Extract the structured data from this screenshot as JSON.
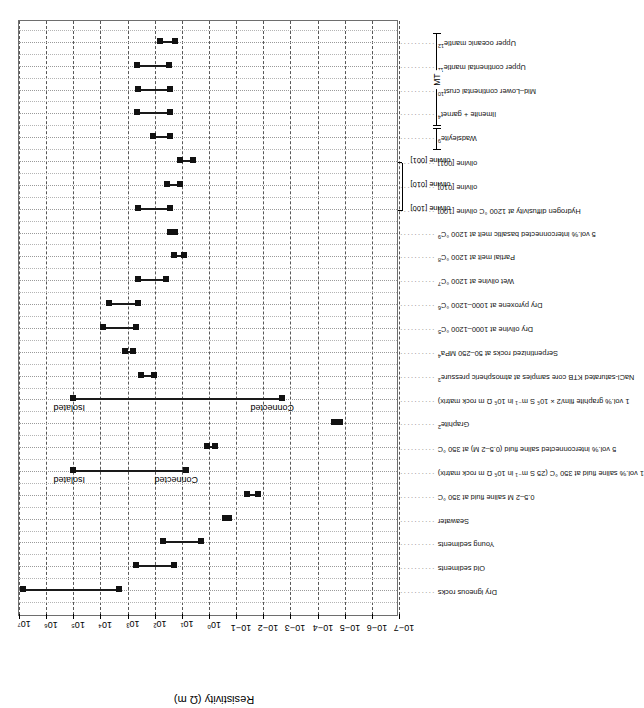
{
  "chart_data": {
    "type": "bar",
    "chart_kind": "range-interval (floating bar) plot, log scale",
    "title": "",
    "xlabel": "",
    "ylabel": "Resistivity (Ω m)",
    "ylim": [
      1e-07,
      10000000.0
    ],
    "y_scale": "log10",
    "grid": true,
    "legend": "none",
    "ytick_labels": [
      "10−7",
      "10−6",
      "10−5",
      "10−4",
      "10−3",
      "10−2",
      "10−1",
      "10⁰",
      "10¹",
      "10²",
      "10³",
      "10⁴",
      "10⁵",
      "10⁶",
      "10⁷"
    ],
    "ytick_values": [
      1e-07,
      1e-06,
      1e-05,
      0.0001,
      0.001,
      0.01,
      0.1,
      1,
      10,
      100,
      1000,
      10000,
      100000,
      1000000,
      10000000
    ],
    "categories": [
      "Dry igneous rocks",
      "Old sediments",
      "Young sediments",
      "Seawater",
      "0.5–2 M saline fluid at 350 °C",
      "1 vol.% saline fluid at 350 °C (25 S m⁻¹ in 10⁵ Ω m rock matrix)",
      "5 vol.% interconnected saline fluid (0.5–2 M) at 350 °C",
      "Graphite",
      "1 vol.% graphite film/2 × 10⁵ S m⁻¹ in 10⁵ Ω m rock matrix)",
      "NaCl-saturated KTB core samples at atmospheric pressure",
      "Serpentinized rocks at 50–250 MPa",
      "Dry olivine at 1000–1200 °C",
      "Dry pyroxene at 1000–1200 °C",
      "Wet olivine at 1200 °C",
      "Partial melt at 1200 °C",
      "5 vol.% interconnected basaltic melt at 1200 °C",
      "Hydrogen diffusivity at 1200 °C  olivine [100]",
      "olivine [010]",
      "olivine [001]",
      "Wadsleyite",
      "Ilmenite + garnet",
      "Mid–Lower continental crust",
      "Upper continental mantle",
      "Upper oceanic mantle"
    ],
    "category_superscripts": {
      "0.5–2 M saline fluid at 350 °C": "",
      "Graphite": "2",
      "NaCl-saturated KTB core samples at atmospheric pressure": "3",
      "Serpentinized rocks at 50–250 MPa": "4",
      "Dry olivine at 1000–1200 °C": "5",
      "Dry pyroxene at 1000–1200 °C": "6",
      "Wet olivine at 1200 °C": "7",
      "Partial melt at 1200 °C": "8",
      "5 vol.% interconnected basaltic melt at 1200 °C": "9",
      "Hydrogen diffusivity at 1200 °C": "10",
      "Wadsleyite": "9",
      "Ilmenite + garnet": "4",
      "Mid–Lower continental crust": "10",
      "Upper continental mantle": "11",
      "Upper oceanic mantle": "12"
    },
    "ranges": [
      {
        "category": "Dry igneous rocks",
        "low": 2000.0,
        "high": 7000000.0
      },
      {
        "category": "Old sediments",
        "low": 20.0,
        "high": 500.0
      },
      {
        "category": "Young sediments",
        "low": 2,
        "high": 50.0
      },
      {
        "category": "Seawater",
        "low": 0.18,
        "high": 0.26
      },
      {
        "category": "0.5–2 M saline fluid at 350 °C",
        "low": 0.015,
        "high": 0.04
      },
      {
        "category": "1 vol.% saline fluid at 350 °C",
        "low": 7,
        "high": 100000.0,
        "note_top": "Isolated",
        "note_bottom": "Connected"
      },
      {
        "category": "5 vol.% interconnected saline fluid",
        "low": 0.6,
        "high": 1.2
      },
      {
        "category": "Graphite",
        "low": 1.5e-05,
        "high": 2.5e-05
      },
      {
        "category": "1 vol.% graphite film",
        "low": 0.002,
        "high": 100000.0,
        "note_top": "Isolated",
        "note_bottom": "Connected"
      },
      {
        "category": "NaCl-saturated KTB core samples",
        "low": 110.0,
        "high": 320.0
      },
      {
        "category": "Serpentinized rocks at 50–250 MPa",
        "low": 650.0,
        "high": 1200.0
      },
      {
        "category": "Dry olivine at 1000–1200 °C",
        "low": 500.0,
        "high": 8000.0
      },
      {
        "category": "Dry pyroxene at 1000–1200 °C",
        "low": 400.0,
        "high": 5000.0
      },
      {
        "category": "Wet olivine at 1200 °C",
        "low": 40.0,
        "high": 400.0
      },
      {
        "category": "Partial melt at 1200 °C",
        "low": 8,
        "high": 20.0
      },
      {
        "category": "5 vol.% interconnected basaltic melt at 1200 °C",
        "low": 18.0,
        "high": 28.0
      },
      {
        "category": "Hydrogen diffusivity olivine [100]",
        "low": 28.0,
        "high": 400.0
      },
      {
        "category": "olivine [010]",
        "low": 12.0,
        "high": 34.0
      },
      {
        "category": "olivine [001]",
        "low": 4.0,
        "high": 12.0
      },
      {
        "category": "Wadsleyite",
        "low": 28.0,
        "high": 120.0
      },
      {
        "category": "Ilmenite + garnet",
        "low": 28.0,
        "high": 450.0
      },
      {
        "category": "Mid–Lower continental crust",
        "low": 28.0,
        "high": 400.0
      },
      {
        "category": "Upper continental mantle",
        "low": 30.0,
        "high": 450.0
      },
      {
        "category": "Upper oceanic mantle",
        "low": 18.0,
        "high": 65.0
      }
    ],
    "annotations": [
      {
        "text": "Isolated",
        "near_category": "1 vol.% saline fluid at 350 °C",
        "at_value": 100000.0
      },
      {
        "text": "Connected",
        "near_category": "1 vol.% saline fluid at 350 °C",
        "at_value": 7
      },
      {
        "text": "Isolated",
        "near_category": "1 vol.% graphite film",
        "at_value": 100000.0
      },
      {
        "text": "Connected",
        "near_category": "1 vol.% graphite film",
        "at_value": 0.002
      },
      {
        "text": "olivine [100]"
      },
      {
        "text": "olivine [010]"
      },
      {
        "text": "olivine [001]"
      }
    ],
    "group_brackets": [
      {
        "label": "BASED ON LABORATORY MEASUREMENTS",
        "from_category": "Dry igneous rocks",
        "to_category": "Hydrogen diffusivity at 1200 °C"
      },
      {
        "label": "",
        "from_category": "Wadsleyite",
        "to_category": "Wadsleyite"
      },
      {
        "label": "MT",
        "from_category": "Ilmenite + garnet",
        "to_category": "Upper oceanic mantle"
      }
    ]
  },
  "axis": {
    "title": "Resistivity (Ω m)"
  },
  "brackets": {
    "lab": "BASED ON LABORATORY MEASUREMENTS",
    "mt": "MT"
  },
  "notes": {
    "isolated": "Isolated",
    "connected": "Connected",
    "olivine_100": "olivine [100]",
    "olivine_010": "olivine [010]",
    "olivine_001": "olivine [001]"
  }
}
